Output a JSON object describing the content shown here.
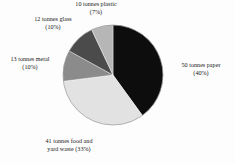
{
  "chart_data": {
    "type": "pie",
    "title": "",
    "subtitle": "",
    "xlabel": "",
    "ylabel": "",
    "units": "tonnes",
    "legend_position": "none",
    "labels_outside": true,
    "grid": false,
    "start_angle_deg": 0,
    "direction": "clockwise",
    "categories": [
      "paper",
      "food and yard waste",
      "metal",
      "glass",
      "plastic"
    ],
    "values": [
      50,
      41,
      13,
      12,
      10
    ],
    "percentages": [
      40,
      33,
      10,
      10,
      7
    ],
    "colors": [
      "#0d0d0d",
      "#e2e2e2",
      "#8b8b8b",
      "#4b4b4b",
      "#b6b6b6"
    ],
    "slices": [
      {
        "name": "paper",
        "value": 50,
        "percent": 40,
        "color": "#0d0d0d",
        "label_line1": "50 tonnes paper",
        "label_line2": "(40%)"
      },
      {
        "name": "food and yard waste",
        "value": 41,
        "percent": 33,
        "color": "#e2e2e2",
        "label_line1": "41 tonnes food and",
        "label_line2": "yard waste (33%)"
      },
      {
        "name": "metal",
        "value": 13,
        "percent": 10,
        "color": "#8b8b8b",
        "label_line1": "13 tonnes metal",
        "label_line2": "(10%)"
      },
      {
        "name": "glass",
        "value": 12,
        "percent": 10,
        "color": "#4b4b4b",
        "label_line1": "12 tonnes glass",
        "label_line2": "(10%)"
      },
      {
        "name": "plastic",
        "value": 10,
        "percent": 7,
        "color": "#b6b6b6",
        "label_line1": "10 tonnes plastic",
        "label_line2": "(7%)"
      }
    ]
  },
  "labels": {
    "plastic": "10 tonnes plastic\n(7%)",
    "glass": "12 tonnes glass\n(10%)",
    "metal": "13 tonnes metal\n(10%)",
    "paper": "50 tonnes paper\n(40%)",
    "food": "41 tonnes food and\nyard waste (33%)"
  },
  "geometry": {
    "center_x": 113,
    "center_y": 75,
    "radius": 50
  },
  "background_color": "#fdfdfd"
}
